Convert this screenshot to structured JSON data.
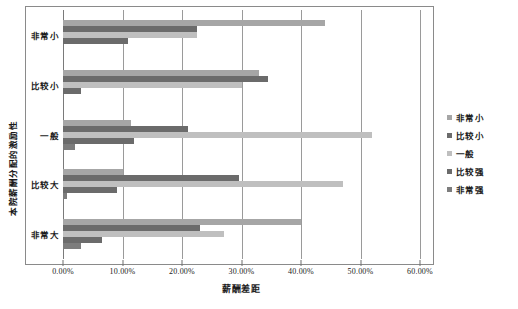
{
  "chart_data": {
    "type": "bar",
    "orientation": "horizontal",
    "title": "",
    "xlabel": "薪酬差距",
    "ylabel": "本院薪酬分配的激励性",
    "xlim": [
      0,
      60
    ],
    "xtick_labels": [
      "0.00%",
      "10.00%",
      "20.00%",
      "30.00%",
      "40.00%",
      "50.00%",
      "60.00%"
    ],
    "xtick_values": [
      0,
      10,
      20,
      30,
      40,
      50,
      60
    ],
    "grid": true,
    "legend_position": "right",
    "categories": [
      "非常小",
      "比较小",
      "一般",
      "比较大",
      "非常大"
    ],
    "series": [
      {
        "name": "非常小",
        "color": "#a6a6a6",
        "values": [
          44.0,
          33.0,
          11.5,
          10.0,
          40.0
        ]
      },
      {
        "name": "比较小",
        "color": "#6b6b6b",
        "values": [
          22.5,
          34.5,
          21.0,
          29.5,
          23.0
        ]
      },
      {
        "name": "一般",
        "color": "#bfbfbf",
        "values": [
          22.5,
          30.0,
          52.0,
          47.0,
          27.0
        ]
      },
      {
        "name": "比较强",
        "color": "#6b6b6b",
        "values": [
          11.0,
          3.0,
          12.0,
          9.0,
          6.5
        ]
      },
      {
        "name": "非常强",
        "color": "#7d7d7d",
        "values": [
          0.0,
          0.0,
          2.0,
          0.6,
          3.0
        ]
      }
    ]
  },
  "legend": {
    "items": [
      {
        "label": "非常小"
      },
      {
        "label": "比较小"
      },
      {
        "label": "一般"
      },
      {
        "label": "比较强"
      },
      {
        "label": "非常强"
      }
    ]
  }
}
